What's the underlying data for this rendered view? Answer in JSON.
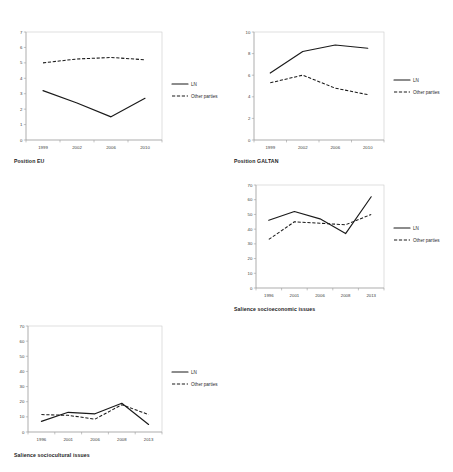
{
  "figure": {
    "background": "#ffffff",
    "line_color": "#1a1a1a",
    "panel_count": 4
  },
  "legend": {
    "series_1_label": "LN",
    "series_2_label": "Other parties"
  },
  "captions": {
    "position_eu": "Position EU",
    "position_galtan": "Position GALTAN",
    "salience_socioeconomic": "Salience socioeconomic issues",
    "salience_sociocultural": "Salience sociocultural issues"
  },
  "chart_data": [
    {
      "type": "line",
      "id": "position-eu",
      "title": "Position EU",
      "xlabel": "",
      "ylabel": "",
      "categories": [
        "1999",
        "2002",
        "2006",
        "2010"
      ],
      "ylim": [
        0,
        7
      ],
      "yticks": [
        0,
        1,
        2,
        3,
        4,
        5,
        6,
        7
      ],
      "grid": false,
      "legend_position": "right",
      "series": [
        {
          "name": "LN",
          "style": "solid",
          "values": [
            3.2,
            2.4,
            1.5,
            2.7
          ]
        },
        {
          "name": "Other parties",
          "style": "dashed",
          "values": [
            5.0,
            5.25,
            5.35,
            5.2
          ]
        }
      ]
    },
    {
      "type": "line",
      "id": "position-galtan",
      "title": "Position GALTAN",
      "xlabel": "",
      "ylabel": "",
      "categories": [
        "1999",
        "2002",
        "2006",
        "2010"
      ],
      "ylim": [
        0,
        10
      ],
      "yticks": [
        0,
        2,
        4,
        6,
        8,
        10
      ],
      "grid": false,
      "legend_position": "right",
      "series": [
        {
          "name": "LN",
          "style": "solid",
          "values": [
            6.2,
            8.2,
            8.8,
            8.5
          ]
        },
        {
          "name": "Other parties",
          "style": "dashed",
          "values": [
            5.3,
            6.0,
            4.8,
            4.2
          ]
        }
      ]
    },
    {
      "type": "line",
      "id": "salience-socioeconomic",
      "title": "Salience socioeconomic issues",
      "xlabel": "",
      "ylabel": "",
      "categories": [
        "1996",
        "2001",
        "2006",
        "2008",
        "2013"
      ],
      "ylim": [
        0,
        70
      ],
      "yticks": [
        0,
        10,
        20,
        30,
        40,
        50,
        60,
        70
      ],
      "grid": false,
      "legend_position": "right",
      "series": [
        {
          "name": "LN",
          "style": "solid",
          "values": [
            46,
            52,
            47,
            37,
            62
          ]
        },
        {
          "name": "Other parties",
          "style": "dashed",
          "values": [
            33,
            45,
            44,
            43,
            50
          ]
        }
      ]
    },
    {
      "type": "line",
      "id": "salience-sociocultural",
      "title": "Salience sociocultural issues",
      "xlabel": "",
      "ylabel": "",
      "categories": [
        "1996",
        "2001",
        "2006",
        "2008",
        "2013"
      ],
      "ylim": [
        0,
        70
      ],
      "yticks": [
        0,
        10,
        20,
        30,
        40,
        50,
        60,
        70
      ],
      "grid": false,
      "legend_position": "right",
      "series": [
        {
          "name": "LN",
          "style": "solid",
          "values": [
            7,
            13,
            12,
            19,
            5
          ]
        },
        {
          "name": "Other parties",
          "style": "dashed",
          "values": [
            11.5,
            11,
            8.5,
            18,
            11.5
          ]
        }
      ]
    }
  ]
}
